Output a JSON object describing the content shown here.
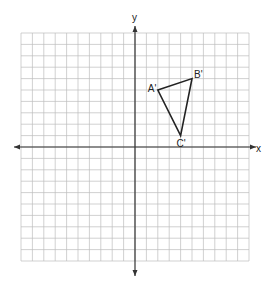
{
  "axes": {
    "x_label": "x",
    "y_label": "y",
    "x_range": [
      -10,
      10
    ],
    "y_range": [
      -10,
      10
    ]
  },
  "grid": {
    "cells": 20,
    "line_color": "#bdbdbd",
    "axis_color": "#333333"
  },
  "triangle": {
    "stroke": "#222222",
    "vertices": [
      {
        "label": "A'",
        "x": 2,
        "y": 5
      },
      {
        "label": "B'",
        "x": 5,
        "y": 6
      },
      {
        "label": "C'",
        "x": 4,
        "y": 1
      }
    ]
  }
}
